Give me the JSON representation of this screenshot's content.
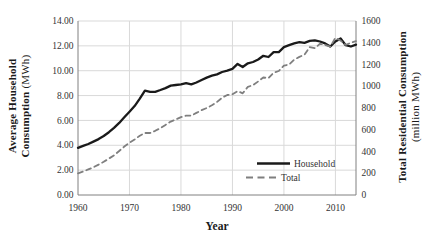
{
  "figure": {
    "x_axis_title": "Year",
    "left_axis_title_line1": "Average Household",
    "left_axis_title_line2_bold": "Consumption",
    "left_axis_title_line2_unit": "(MWh)",
    "right_axis_title_line1": "Total Residential Consumption",
    "right_axis_title_line2": "(million MWh)"
  },
  "axes": {
    "left_ticks": [
      "14.00",
      "12.00",
      "10.00",
      "8.00",
      "6.00",
      "4.00",
      "2.00",
      "0.00"
    ],
    "right_ticks": [
      "1600",
      "1400",
      "1200",
      "1000",
      "800",
      "600",
      "400",
      "200",
      "0"
    ],
    "x_ticks": [
      "1960",
      "1970",
      "1980",
      "1990",
      "2000",
      "2010"
    ]
  },
  "legend": [
    {
      "label": "Household",
      "line_style": "solid"
    },
    {
      "label": "Total",
      "line_style": "dashed"
    }
  ],
  "colors": {
    "household_line": "#1a1a1a",
    "total_line": "#7f7f7f",
    "gridline": "#d9d9d9",
    "axis_line": "#808080",
    "tick_text": "#333333"
  },
  "chart_data": {
    "type": "line",
    "xlabel": "Year",
    "x_domain": [
      1960,
      2014
    ],
    "left_axis": {
      "label": "Average Household Consumption (MWh)",
      "lim": [
        0,
        14
      ],
      "tick_step": 2
    },
    "right_axis": {
      "label": "Total Residential Consumption (million MWh)",
      "lim": [
        0,
        1600
      ],
      "tick_step": 200
    },
    "grid": true,
    "legend_position": "inside-bottom-right",
    "x": [
      1960,
      1961,
      1962,
      1963,
      1964,
      1965,
      1966,
      1967,
      1968,
      1969,
      1970,
      1971,
      1972,
      1973,
      1974,
      1975,
      1976,
      1977,
      1978,
      1979,
      1980,
      1981,
      1982,
      1983,
      1984,
      1985,
      1986,
      1987,
      1988,
      1989,
      1990,
      1991,
      1992,
      1993,
      1994,
      1995,
      1996,
      1997,
      1998,
      1999,
      2000,
      2001,
      2002,
      2003,
      2004,
      2005,
      2006,
      2007,
      2008,
      2009,
      2010,
      2011,
      2012,
      2013,
      2014
    ],
    "series": [
      {
        "name": "Household",
        "axis": "left",
        "line_style": "solid",
        "color": "#1a1a1a",
        "values": [
          3.8,
          3.95,
          4.1,
          4.3,
          4.5,
          4.75,
          5.05,
          5.4,
          5.8,
          6.25,
          6.7,
          7.15,
          7.75,
          8.4,
          8.3,
          8.3,
          8.45,
          8.6,
          8.8,
          8.85,
          8.9,
          9.0,
          8.9,
          9.05,
          9.25,
          9.45,
          9.6,
          9.7,
          9.9,
          10.0,
          10.15,
          10.55,
          10.3,
          10.6,
          10.7,
          10.9,
          11.2,
          11.1,
          11.5,
          11.5,
          11.9,
          12.05,
          12.2,
          12.3,
          12.25,
          12.4,
          12.45,
          12.35,
          12.2,
          11.95,
          12.35,
          12.6,
          12.05,
          11.95,
          12.1
        ]
      },
      {
        "name": "Total",
        "axis": "right",
        "line_style": "dashed",
        "color": "#7f7f7f",
        "values": [
          200,
          215,
          235,
          255,
          280,
          305,
          335,
          365,
          405,
          445,
          480,
          510,
          545,
          570,
          570,
          590,
          615,
          645,
          675,
          695,
          715,
          730,
          730,
          755,
          780,
          800,
          825,
          855,
          895,
          920,
          925,
          955,
          935,
          995,
          1010,
          1045,
          1080,
          1075,
          1125,
          1140,
          1190,
          1200,
          1245,
          1270,
          1290,
          1360,
          1350,
          1390,
          1380,
          1365,
          1445,
          1420,
          1380,
          1400,
          1415
        ]
      }
    ]
  }
}
